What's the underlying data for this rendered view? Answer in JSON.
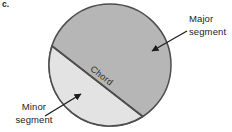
{
  "figure_label": "c.",
  "diagram": {
    "labels": {
      "major_line1": "Major",
      "major_line2": "segment",
      "minor_line1": "Minor",
      "minor_line2": "segment",
      "chord": "Chord"
    },
    "colors": {
      "major_fill": "#b6b6b6",
      "minor_fill": "#e3e3e3",
      "outline": "#4d4d4d",
      "annotation": "#1c1c1c"
    }
  }
}
